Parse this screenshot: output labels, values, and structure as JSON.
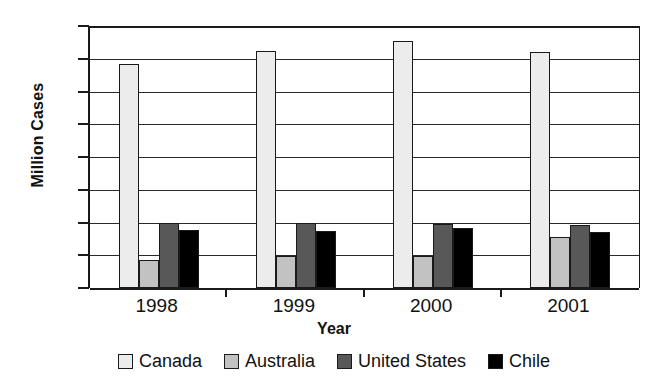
{
  "chart_data": {
    "type": "bar",
    "title": "",
    "xlabel": "Year",
    "ylabel": "Million Cases",
    "categories": [
      "1998",
      "1999",
      "2000",
      "2001"
    ],
    "series": [
      {
        "name": "Canada",
        "color": "#ececec",
        "values": [
          6.85,
          7.25,
          7.55,
          7.2
        ]
      },
      {
        "name": "Australia",
        "color": "#c2c2c2",
        "values": [
          0.85,
          0.97,
          0.97,
          1.55
        ]
      },
      {
        "name": "United States",
        "color": "#585858",
        "values": [
          2.0,
          2.0,
          1.95,
          1.92
        ]
      },
      {
        "name": "Chile",
        "color": "#000000",
        "values": [
          1.78,
          1.75,
          1.82,
          1.72
        ]
      }
    ],
    "ylim": [
      0,
      8
    ],
    "yticks": [
      "0",
      "1",
      "2",
      "3",
      "4",
      "5",
      "6",
      "7",
      "8"
    ],
    "grid": true,
    "legend_position": "bottom"
  }
}
